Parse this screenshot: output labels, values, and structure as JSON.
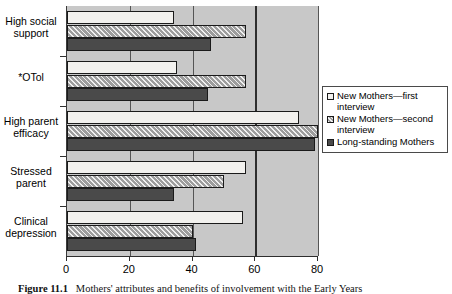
{
  "chart_data": {
    "type": "bar",
    "orientation": "horizontal",
    "title": "",
    "xlabel": "",
    "ylabel": "",
    "xlim": [
      0,
      80
    ],
    "xticks": [
      0,
      20,
      40,
      60,
      80
    ],
    "xtick_labels": [
      "0",
      "20",
      "40",
      "60",
      "80"
    ],
    "grid": true,
    "legend_position": "right",
    "categories": [
      "High social support",
      "*OTol",
      "High parent efficacy",
      "Stressed parent",
      "Clinical depression"
    ],
    "series": [
      {
        "name": "New Mothers—first interview",
        "key": "new-mothers-first",
        "pattern": "solid-light",
        "color": "#f2f1ee",
        "values": [
          34,
          35,
          74,
          57,
          56
        ]
      },
      {
        "name": "New Mothers—second interview",
        "key": "new-mothers-second",
        "pattern": "hatched",
        "color": "#9d9d9d",
        "values": [
          57,
          57,
          80,
          50,
          40
        ]
      },
      {
        "name": "Long-standing Mothers",
        "key": "long-standing-mothers",
        "pattern": "solid-dark",
        "color": "#4a4a4a",
        "values": [
          46,
          45,
          79,
          34,
          41
        ]
      }
    ]
  },
  "legend": {
    "items": [
      {
        "label_line1": "New Mothers—first",
        "label_line2": "interview"
      },
      {
        "label_line1": "New Mothers—second",
        "label_line2": "interview"
      },
      {
        "label_line1": "Long-standing Mothers",
        "label_line2": ""
      }
    ]
  },
  "category_labels": [
    {
      "line1": "High social",
      "line2": "support"
    },
    {
      "line1": "*OTol",
      "line2": ""
    },
    {
      "line1": "High parent",
      "line2": "efficacy"
    },
    {
      "line1": "Stressed",
      "line2": "parent"
    },
    {
      "line1": "Clinical",
      "line2": "depression"
    }
  ],
  "caption": {
    "figure_number": "Figure 11.1",
    "text": "Mothers' attributes and benefits of involvement with the Early Years"
  }
}
